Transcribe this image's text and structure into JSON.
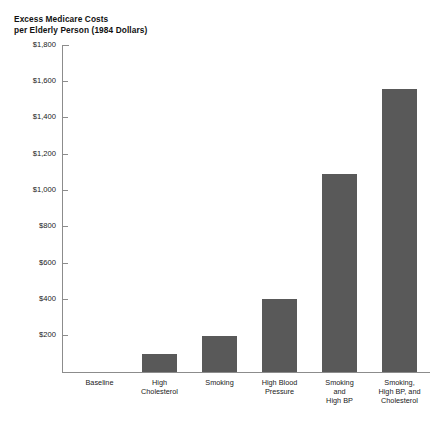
{
  "chart_data": {
    "type": "bar",
    "title": "Excess Medicare Costs per Elderly Person (1984 Dollars)",
    "title_lines": [
      "Excess Medicare Costs",
      "per Elderly Person (1984 Dollars)"
    ],
    "xlabel": "",
    "ylabel": "",
    "ylim": [
      0,
      1800
    ],
    "ytick_values": [
      200,
      400,
      600,
      800,
      1000,
      1200,
      1400,
      1600,
      1800
    ],
    "ytick_labels": [
      "$200",
      "$400",
      "$600",
      "$800",
      "$1,000",
      "$1,200",
      "$1,400",
      "$1,600",
      "$1,800"
    ],
    "grid": false,
    "legend": false,
    "bar_color": "#595959",
    "axis_color": "#8c8c8c",
    "categories": [
      "Baseline",
      "High Cholesterol",
      "Smoking",
      "High Blood Pressure",
      "Smoking and High BP",
      "Smoking, High BP, and Cholesterol"
    ],
    "category_lines": [
      [
        "Baseline"
      ],
      [
        "High",
        "Cholesterol"
      ],
      [
        "Smoking"
      ],
      [
        "High Blood",
        "Pressure"
      ],
      [
        "Smoking",
        "and",
        "High BP"
      ],
      [
        "Smoking,",
        "High BP, and",
        "Cholesterol"
      ]
    ],
    "values": [
      0,
      100,
      200,
      400,
      1090,
      1560
    ]
  }
}
